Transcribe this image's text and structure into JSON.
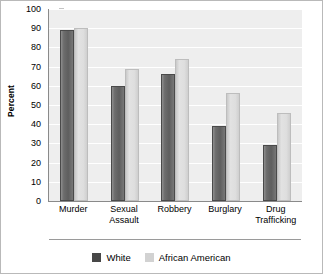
{
  "chart_data": {
    "type": "bar",
    "title": "",
    "xlabel": "",
    "ylabel": "Percent",
    "ylim": [
      0,
      100
    ],
    "ytick_step": 10,
    "yticks": [
      100,
      90,
      80,
      70,
      60,
      50,
      40,
      30,
      20,
      10,
      0
    ],
    "grid": true,
    "legend_position": "bottom-center",
    "categories": [
      "Murder",
      "Sexual Assault",
      "Robbery",
      "Burglary",
      "Drug Trafficking"
    ],
    "series": [
      {
        "name": "White",
        "color": "#5e5e5e",
        "values": [
          89,
          60,
          66,
          39,
          29
        ]
      },
      {
        "name": "African American",
        "color": "#dedede",
        "values": [
          90,
          69,
          74,
          56,
          46
        ]
      }
    ]
  },
  "axis": {
    "y_label": "Percent"
  },
  "legend": {
    "items": [
      {
        "label": "White"
      },
      {
        "label": "African American"
      }
    ]
  },
  "colors": {
    "plot_background": "#eeeeee",
    "gridline": "#ffffff",
    "axis_line": "#8a8a8a",
    "figure_border": "#b9b9b9",
    "series_white": "#5e5e5e",
    "series_african_american": "#dedede"
  }
}
